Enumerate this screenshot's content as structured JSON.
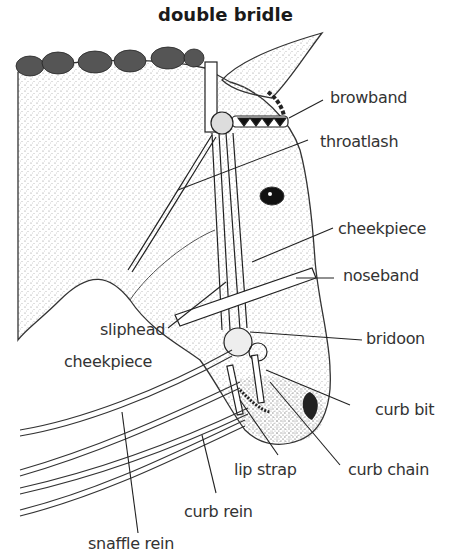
{
  "title": "double bridle",
  "labels": {
    "browband": "browband",
    "throatlash": "throatlash",
    "cheekpiece": "cheekpiece",
    "noseband": "noseband",
    "sliphead_line1": "sliphead",
    "sliphead_line2": "cheekpiece",
    "bridoon": "bridoon",
    "curb_bit": "curb bit",
    "lip_strap": "lip strap",
    "curb_chain": "curb chain",
    "curb_rein": "curb rein",
    "snaffle_rein": "snaffle rein"
  },
  "colors": {
    "ink": "#222222",
    "stipple": "#9a9a9a",
    "background": "#ffffff"
  }
}
